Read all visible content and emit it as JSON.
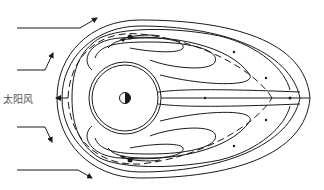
{
  "diagram": {
    "title": "",
    "labels": {
      "solar_wind": "太阳风"
    },
    "elements": {
      "earth_symbol": "earth-half-shaded-icon",
      "inner_sphere": "double-circle",
      "magnetopause": "bullet-shaped-outer-boundary",
      "dashed_line": "separatrix",
      "convection_cells": [
        "upper-cell",
        "lower-cell"
      ],
      "inflow_arrows": 4
    },
    "colors": {
      "ink": "#1a1a1a",
      "background": "#ffffff",
      "label": "#555555"
    }
  }
}
